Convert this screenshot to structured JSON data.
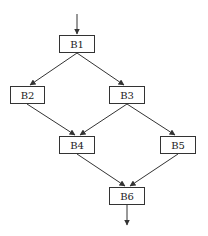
{
  "diagram": {
    "type": "control-flow-graph",
    "nodes": [
      {
        "id": "B1",
        "label": "B1",
        "x": 59,
        "y": 35,
        "w": 36,
        "h": 18
      },
      {
        "id": "B2",
        "label": "B2",
        "x": 10,
        "y": 86,
        "w": 35,
        "h": 18
      },
      {
        "id": "B3",
        "label": "B3",
        "x": 109,
        "y": 86,
        "w": 36,
        "h": 18
      },
      {
        "id": "B4",
        "label": "B4",
        "x": 59,
        "y": 136,
        "w": 36,
        "h": 18
      },
      {
        "id": "B5",
        "label": "B5",
        "x": 160,
        "y": 136,
        "w": 36,
        "h": 18
      },
      {
        "id": "B6",
        "label": "B6",
        "x": 109,
        "y": 187,
        "w": 36,
        "h": 18
      }
    ],
    "edges": [
      {
        "from": "entry",
        "to": "B1"
      },
      {
        "from": "B1",
        "to": "B2"
      },
      {
        "from": "B1",
        "to": "B3"
      },
      {
        "from": "B2",
        "to": "B4"
      },
      {
        "from": "B3",
        "to": "B4"
      },
      {
        "from": "B3",
        "to": "B5"
      },
      {
        "from": "B4",
        "to": "B6"
      },
      {
        "from": "B5",
        "to": "B6"
      },
      {
        "from": "B6",
        "to": "exit"
      }
    ],
    "colors": {
      "line": "#333333",
      "box_border": "#333333",
      "text": "#222222"
    }
  }
}
